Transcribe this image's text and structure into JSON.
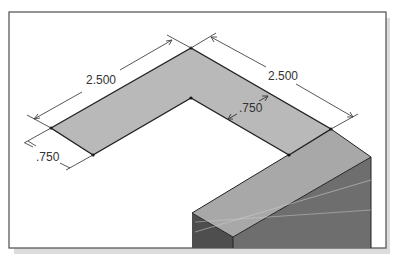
{
  "figure": {
    "type": "isometric-L-shape-with-extruded-block",
    "colors": {
      "frame": "#5a5a5a",
      "frame_shadow": "#d8d8d8",
      "background": "#ffffff",
      "top_face": "#b9b9b9",
      "block_top": "#a8a8a8",
      "block_left": "#4e4e4e",
      "block_right": "#6e6e6e",
      "outline": "#222222",
      "dimension_line": "#444444"
    }
  },
  "dimensions": {
    "left_length": "2.500",
    "right_length": "2.500",
    "left_width": ".750",
    "inner_width": ".750"
  }
}
